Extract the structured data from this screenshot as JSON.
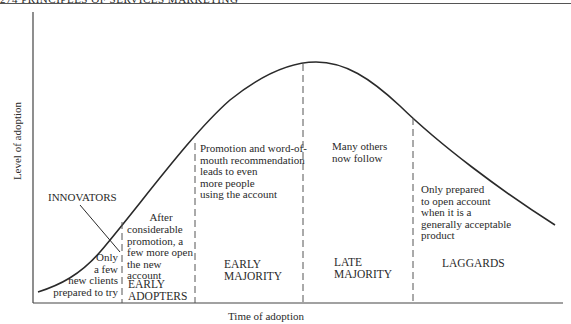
{
  "header": {
    "running_title": "274  PRINCIPLES OF SERVICES MARKETING"
  },
  "axes": {
    "y_label": "Level of adoption",
    "x_label": "Time of adoption"
  },
  "segments": [
    {
      "name": "INNOVATORS",
      "description": [
        "Only",
        "a few",
        "new clients",
        "prepared to try"
      ]
    },
    {
      "name": [
        "EARLY",
        "ADOPTERS"
      ],
      "description": [
        "After",
        "considerable",
        "promotion, a",
        "few more open",
        "the new",
        "account"
      ]
    },
    {
      "name": [
        "EARLY",
        "MAJORITY"
      ],
      "description": [
        "Promotion and word-of-",
        "mouth recommendation",
        "leads to even",
        "more people",
        "using the account"
      ]
    },
    {
      "name": [
        "LATE",
        "MAJORITY"
      ],
      "description": [
        "Many others",
        "now follow"
      ]
    },
    {
      "name": "LAGGARDS",
      "description": [
        "Only prepared",
        "to open account",
        "when it is a",
        "generally acceptable",
        "product"
      ]
    }
  ],
  "colors": {
    "ink": "#2a2a2a",
    "background": "#ffffff"
  }
}
